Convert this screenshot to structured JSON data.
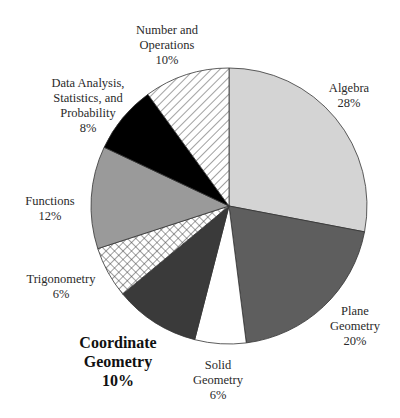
{
  "chart_data": {
    "type": "pie",
    "title": "",
    "start_angle_deg": 0,
    "direction": "clockwise",
    "center": [
      229,
      206
    ],
    "radius": 138,
    "slices": [
      {
        "label": "Algebra",
        "value": 28,
        "display": "28%",
        "fill": "#d4d4d4",
        "pattern": "solid",
        "label_pos": [
          349,
          81
        ],
        "bold": false
      },
      {
        "label": "Plane Geometry",
        "value": 20,
        "display": "20%",
        "fill": "#5e5e5e",
        "pattern": "solid",
        "label_pos": [
          355,
          304
        ],
        "bold": false
      },
      {
        "label": "Solid Geometry",
        "value": 6,
        "display": "6%",
        "fill": "#ffffff",
        "pattern": "solid",
        "label_pos": [
          218,
          358
        ],
        "bold": false
      },
      {
        "label": "Coordinate Geometry",
        "value": 10,
        "display": "10%",
        "fill": "#3a3a3a",
        "pattern": "solid",
        "label_pos": [
          118,
          333
        ],
        "bold": true
      },
      {
        "label": "Trigonometry",
        "value": 6,
        "display": "6%",
        "fill": "#ffffff",
        "pattern": "crosshatch",
        "label_pos": [
          61,
          272
        ],
        "bold": false
      },
      {
        "label": "Functions",
        "value": 12,
        "display": "12%",
        "fill": "#9a9a9a",
        "pattern": "solid",
        "label_pos": [
          50,
          194
        ],
        "bold": false
      },
      {
        "label": "Data Analysis, Statistics, and Probability",
        "lines": [
          "Data Analysis,",
          "Statistics, and",
          "Probability"
        ],
        "value": 8,
        "display": "8%",
        "fill": "#000000",
        "pattern": "solid",
        "label_pos": [
          88,
          76
        ],
        "bold": false
      },
      {
        "label": "Number and Operations",
        "lines": [
          "Number and",
          "Operations"
        ],
        "value": 10,
        "display": "10%",
        "fill": "#ffffff",
        "pattern": "diagonal",
        "label_pos": [
          167,
          23
        ],
        "bold": false
      }
    ],
    "legend": "none",
    "total": 100
  }
}
